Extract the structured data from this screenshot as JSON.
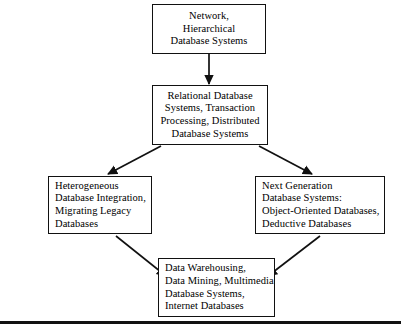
{
  "diagram": {
    "type": "flowchart",
    "orientation": "top-down",
    "background_color": "#ffffff",
    "line_color": "#111111",
    "text_color": "#000000",
    "nodes": [
      {
        "id": "node-top",
        "name": "network-hierarchical-node",
        "align": "center",
        "lines": [
          "Network,",
          "Hierarchical",
          "Database Systems"
        ]
      },
      {
        "id": "node-relational",
        "name": "relational-node",
        "align": "center",
        "lines": [
          "Relational Database",
          "Systems, Transaction",
          "Processing, Distributed",
          "Database Systems"
        ]
      },
      {
        "id": "node-hetero",
        "name": "heterogeneous-node",
        "align": "left",
        "lines": [
          "Heterogeneous",
          "Database Integration,",
          "Migrating Legacy",
          "Databases"
        ]
      },
      {
        "id": "node-nextgen",
        "name": "next-generation-node",
        "align": "left",
        "lines": [
          "Next Generation",
          "Database Systems:",
          "Object-Oriented Databases,",
          "Deductive Databases"
        ]
      },
      {
        "id": "node-warehouse",
        "name": "data-warehousing-node",
        "align": "left",
        "lines": [
          "Data Warehousing,",
          "Data Mining, Multimedia",
          "Database Systems,",
          "Internet Databases"
        ]
      }
    ],
    "edges": [
      {
        "name": "edge-top-to-relational",
        "from": "node-top",
        "to": "node-relational",
        "style": "straight-down"
      },
      {
        "name": "edge-relational-to-hetero",
        "from": "node-relational",
        "to": "node-hetero",
        "style": "diagonal-left"
      },
      {
        "name": "edge-relational-to-nextgen",
        "from": "node-relational",
        "to": "node-nextgen",
        "style": "diagonal-right"
      },
      {
        "name": "edge-hetero-to-warehouse",
        "from": "node-hetero",
        "to": "node-warehouse",
        "style": "diagonal-right-down"
      },
      {
        "name": "edge-nextgen-to-warehouse",
        "from": "node-nextgen",
        "to": "node-warehouse",
        "style": "diagonal-left-down"
      }
    ],
    "rule": {
      "name": "bottom-horizontal-rule",
      "present": true
    }
  }
}
